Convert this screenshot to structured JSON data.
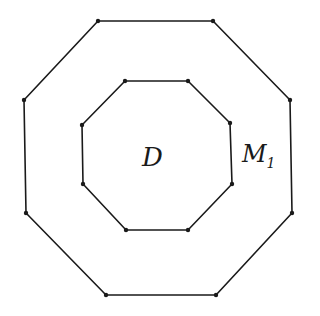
{
  "diagram": {
    "outer_octagon": {
      "points": [
        [
          98,
          21
        ],
        [
          213,
          21
        ],
        [
          290,
          100
        ],
        [
          292,
          213
        ],
        [
          216,
          295
        ],
        [
          106,
          295
        ],
        [
          26,
          213
        ],
        [
          24,
          100
        ]
      ]
    },
    "inner_octagon": {
      "points": [
        [
          125,
          81
        ],
        [
          188,
          81
        ],
        [
          230,
          123
        ],
        [
          232,
          184
        ],
        [
          188,
          230
        ],
        [
          126,
          230
        ],
        [
          83,
          184
        ],
        [
          82,
          125
        ]
      ]
    },
    "labels": {
      "inner_region": "D",
      "ring_region": "M",
      "ring_subscript": "1"
    },
    "stroke_color": "#1a1a1a",
    "background": "#ffffff"
  }
}
